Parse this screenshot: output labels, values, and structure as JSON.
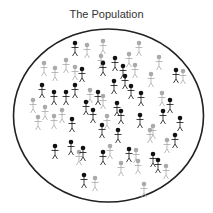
{
  "title": "The Population",
  "colors": {
    "background": "#ffffff",
    "boundary": "#222222",
    "dark_person": "#111111",
    "light_person": "#aaaaaa",
    "title_text": "#333333"
  },
  "boundary": {
    "shape": "ellipse",
    "cx": 108.5,
    "cy": 115.5,
    "rx": 95,
    "ry": 86.5
  },
  "people": [
    {
      "x": 75,
      "y": 43,
      "tone": "dark"
    },
    {
      "x": 87,
      "y": 45,
      "tone": "light"
    },
    {
      "x": 103,
      "y": 41,
      "tone": "light"
    },
    {
      "x": 139,
      "y": 43,
      "tone": "light"
    },
    {
      "x": 44,
      "y": 63,
      "tone": "light"
    },
    {
      "x": 55,
      "y": 68,
      "tone": "light"
    },
    {
      "x": 66,
      "y": 60,
      "tone": "light"
    },
    {
      "x": 75,
      "y": 67,
      "tone": "light"
    },
    {
      "x": 82,
      "y": 69,
      "tone": "dark"
    },
    {
      "x": 101,
      "y": 56,
      "tone": "light"
    },
    {
      "x": 115,
      "y": 58,
      "tone": "dark"
    },
    {
      "x": 129,
      "y": 54,
      "tone": "light"
    },
    {
      "x": 123,
      "y": 66,
      "tone": "dark"
    },
    {
      "x": 159,
      "y": 57,
      "tone": "light"
    },
    {
      "x": 183,
      "y": 71,
      "tone": "light"
    },
    {
      "x": 103,
      "y": 63,
      "tone": "dark"
    },
    {
      "x": 114,
      "y": 81,
      "tone": "dark"
    },
    {
      "x": 125,
      "y": 76,
      "tone": "dark"
    },
    {
      "x": 135,
      "y": 65,
      "tone": "light"
    },
    {
      "x": 131,
      "y": 86,
      "tone": "dark"
    },
    {
      "x": 151,
      "y": 74,
      "tone": "light"
    },
    {
      "x": 176,
      "y": 70,
      "tone": "dark"
    },
    {
      "x": 42,
      "y": 85,
      "tone": "dark"
    },
    {
      "x": 54,
      "y": 92,
      "tone": "dark"
    },
    {
      "x": 66,
      "y": 92,
      "tone": "dark"
    },
    {
      "x": 75,
      "y": 85,
      "tone": "dark"
    },
    {
      "x": 90,
      "y": 90,
      "tone": "light"
    },
    {
      "x": 98,
      "y": 92,
      "tone": "dark"
    },
    {
      "x": 33,
      "y": 100,
      "tone": "light"
    },
    {
      "x": 45,
      "y": 107,
      "tone": "light"
    },
    {
      "x": 86,
      "y": 102,
      "tone": "dark"
    },
    {
      "x": 103,
      "y": 96,
      "tone": "light"
    },
    {
      "x": 117,
      "y": 103,
      "tone": "dark"
    },
    {
      "x": 141,
      "y": 93,
      "tone": "dark"
    },
    {
      "x": 162,
      "y": 93,
      "tone": "light"
    },
    {
      "x": 170,
      "y": 100,
      "tone": "dark"
    },
    {
      "x": 180,
      "y": 118,
      "tone": "dark"
    },
    {
      "x": 38,
      "y": 117,
      "tone": "light"
    },
    {
      "x": 54,
      "y": 116,
      "tone": "light"
    },
    {
      "x": 62,
      "y": 110,
      "tone": "light"
    },
    {
      "x": 72,
      "y": 119,
      "tone": "dark"
    },
    {
      "x": 93,
      "y": 110,
      "tone": "dark"
    },
    {
      "x": 107,
      "y": 116,
      "tone": "light"
    },
    {
      "x": 121,
      "y": 111,
      "tone": "dark"
    },
    {
      "x": 140,
      "y": 115,
      "tone": "dark"
    },
    {
      "x": 153,
      "y": 126,
      "tone": "light"
    },
    {
      "x": 163,
      "y": 111,
      "tone": "dark"
    },
    {
      "x": 102,
      "y": 125,
      "tone": "dark"
    },
    {
      "x": 118,
      "y": 130,
      "tone": "dark"
    },
    {
      "x": 150,
      "y": 130,
      "tone": "light"
    },
    {
      "x": 167,
      "y": 140,
      "tone": "light"
    },
    {
      "x": 175,
      "y": 135,
      "tone": "dark"
    },
    {
      "x": 55,
      "y": 146,
      "tone": "dark"
    },
    {
      "x": 71,
      "y": 142,
      "tone": "dark"
    },
    {
      "x": 79,
      "y": 152,
      "tone": "light"
    },
    {
      "x": 83,
      "y": 148,
      "tone": "dark"
    },
    {
      "x": 103,
      "y": 152,
      "tone": "dark"
    },
    {
      "x": 110,
      "y": 146,
      "tone": "light"
    },
    {
      "x": 129,
      "y": 149,
      "tone": "dark"
    },
    {
      "x": 136,
      "y": 150,
      "tone": "light"
    },
    {
      "x": 121,
      "y": 163,
      "tone": "light"
    },
    {
      "x": 138,
      "y": 161,
      "tone": "light"
    },
    {
      "x": 153,
      "y": 154,
      "tone": "dark"
    },
    {
      "x": 95,
      "y": 178,
      "tone": "light"
    },
    {
      "x": 84,
      "y": 175,
      "tone": "dark"
    },
    {
      "x": 144,
      "y": 184,
      "tone": "light"
    },
    {
      "x": 166,
      "y": 166,
      "tone": "light"
    },
    {
      "x": 158,
      "y": 160,
      "tone": "dark"
    }
  ]
}
